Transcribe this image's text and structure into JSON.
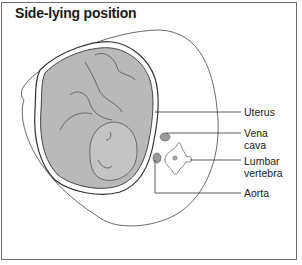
{
  "title": "Side-lying position",
  "labels": {
    "uterus": "Uterus",
    "vena_cava": [
      "Vena",
      "cava"
    ],
    "lumbar_vertebra": [
      "Lumbar",
      "vertebra"
    ],
    "aorta": "Aorta"
  },
  "colors": {
    "border": "#6e6e6e",
    "fetus_fill": "#b9b9b9",
    "uterus_fill": "#a8a8a8",
    "outline": "#3a3a3a",
    "vessel_fill": "#9a9a9a"
  }
}
